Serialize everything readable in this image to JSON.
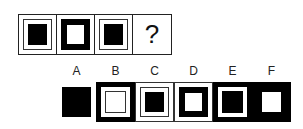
{
  "sequence": {
    "cells": [
      {
        "pattern": "outline-with-black-center"
      },
      {
        "pattern": "thick-black-frame-white-center"
      },
      {
        "pattern": "outline-with-black-center"
      },
      {
        "pattern": "unknown",
        "text": "?"
      }
    ]
  },
  "options": [
    {
      "label": "A",
      "pattern": "large-black-square"
    },
    {
      "label": "B",
      "pattern": "black-bg-white-frame-outlined-white-center"
    },
    {
      "label": "C",
      "pattern": "outline-with-black-center"
    },
    {
      "label": "D",
      "pattern": "thick-black-frame-white-center"
    },
    {
      "label": "E",
      "pattern": "black-bg-white-ring-black-center"
    },
    {
      "label": "F",
      "pattern": "black-bg-white-square"
    }
  ],
  "colors": {
    "ink": "#000000",
    "paper": "#ffffff"
  }
}
